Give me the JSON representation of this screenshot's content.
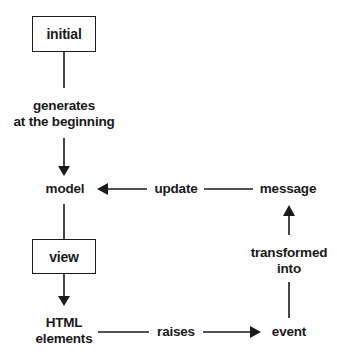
{
  "diagram": {
    "type": "flow",
    "stroke_color": "#1a1a1a",
    "nodes": {
      "initial": "initial",
      "generates_line1": "generates",
      "generates_line2": "at the beginning",
      "model": "model",
      "update": "update",
      "message": "message",
      "view": "view",
      "html_line1": "HTML",
      "html_line2": "elements",
      "raises": "raises",
      "event": "event",
      "transformed_line1": "transformed",
      "transformed_line2": "into"
    },
    "edges": [
      {
        "from": "initial",
        "to": "model",
        "label": "generates at the beginning"
      },
      {
        "from": "model",
        "to": "HTML elements",
        "label": "view"
      },
      {
        "from": "HTML elements",
        "to": "event",
        "label": "raises"
      },
      {
        "from": "event",
        "to": "message",
        "label": "transformed into"
      },
      {
        "from": "message",
        "to": "model",
        "label": "update"
      }
    ]
  }
}
